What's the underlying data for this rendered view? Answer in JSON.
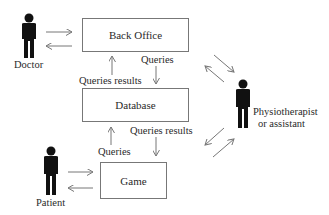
{
  "diagram": {
    "nodes": {
      "back_office": {
        "label": "Back Office"
      },
      "database": {
        "label": "Database"
      },
      "game": {
        "label": "Game"
      }
    },
    "actors": {
      "doctor": {
        "label": "Doctor"
      },
      "patient": {
        "label": "Patient"
      },
      "physio": {
        "label_line1": "Physiotherapist",
        "label_line2": "or assistant"
      }
    },
    "edge_labels": {
      "bo_to_db": "Queries",
      "db_to_bo": "Queries results",
      "db_to_game": "Queries results",
      "game_to_db": "Queries"
    },
    "edges": [
      {
        "from": "Doctor",
        "to": "Back Office"
      },
      {
        "from": "Back Office",
        "to": "Doctor"
      },
      {
        "from": "Back Office",
        "to": "Database",
        "label": "Queries"
      },
      {
        "from": "Database",
        "to": "Back Office",
        "label": "Queries results"
      },
      {
        "from": "Database",
        "to": "Game",
        "label": "Queries results"
      },
      {
        "from": "Game",
        "to": "Database",
        "label": "Queries"
      },
      {
        "from": "Patient",
        "to": "Game"
      },
      {
        "from": "Game",
        "to": "Patient"
      },
      {
        "from": "Back Office",
        "to": "Physiotherapist or assistant"
      },
      {
        "from": "Physiotherapist or assistant",
        "to": "Back Office"
      },
      {
        "from": "Physiotherapist or assistant",
        "to": "Database"
      },
      {
        "from": "Database",
        "to": "Physiotherapist or assistant"
      }
    ],
    "colors": {
      "line": "#777777",
      "figure": "#111111",
      "text": "#2a2a2a"
    }
  }
}
